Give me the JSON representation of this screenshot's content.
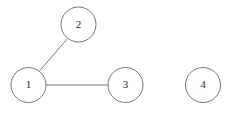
{
  "diagram": {
    "type": "node-link-graph",
    "width": 230,
    "height": 117,
    "background_color": "#ffffff",
    "stroke_color": "#777777",
    "label_color": "#2b2b2b",
    "node_radius": 17.5,
    "nodes": [
      {
        "id": "1",
        "label": "1",
        "cx": 28.5,
        "cy": 85.0
      },
      {
        "id": "2",
        "label": "2",
        "cx": 78.5,
        "cy": 24.5
      },
      {
        "id": "3",
        "label": "3",
        "cx": 125.5,
        "cy": 85.0
      },
      {
        "id": "4",
        "label": "4",
        "cx": 203.0,
        "cy": 85.0
      }
    ],
    "edges": [
      {
        "id": "edge-1-2",
        "from": "1",
        "to": "2",
        "x1": 40.0,
        "y1": 70.3,
        "x2": 67.0,
        "y2": 39.2
      },
      {
        "id": "edge-1-3",
        "from": "1",
        "to": "3",
        "x1": 46.0,
        "y1": 85.0,
        "x2": 108.0,
        "y2": 85.0
      }
    ],
    "isolated_nodes": [
      "4"
    ]
  }
}
